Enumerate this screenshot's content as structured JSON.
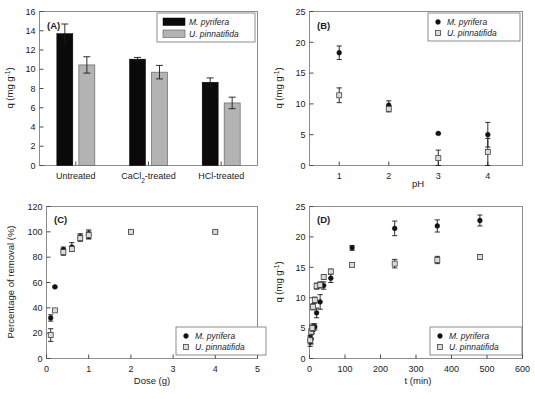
{
  "figure": {
    "series": {
      "a_name": "M. pyrifera",
      "b_name": "U. pinnatifida",
      "a_color": "#0a0a0a",
      "b_color": "#b3b3b3"
    }
  },
  "chart_data": [
    {
      "panel": "A",
      "label": "(A)",
      "type": "bar",
      "title": "",
      "xlabel": "",
      "ylabel": "q (mg g⁻¹)",
      "categories": [
        "Untreated",
        "CaCl₂-treated",
        "HCl-treated"
      ],
      "ylim": [
        0,
        16
      ],
      "yticks": [
        0,
        2,
        4,
        6,
        8,
        10,
        12,
        14,
        16
      ],
      "grid": false,
      "legend_position": "top-right",
      "series": [
        {
          "name": "M. pyrifera",
          "values": [
            13.7,
            11.05,
            8.65
          ],
          "errors": [
            1.0,
            0.18,
            0.45
          ]
        },
        {
          "name": "U. pinnatifida",
          "values": [
            10.45,
            9.7,
            6.5
          ],
          "errors": [
            0.85,
            0.7,
            0.6
          ]
        }
      ]
    },
    {
      "panel": "B",
      "label": "(B)",
      "type": "scatter",
      "title": "",
      "xlabel": "pH",
      "ylabel": "q (mg g⁻¹)",
      "xlim": [
        0.4,
        4.7
      ],
      "ylim": [
        0,
        25
      ],
      "xticks": [
        1,
        2,
        3,
        4
      ],
      "yticks": [
        0,
        5,
        10,
        15,
        20,
        25
      ],
      "grid": false,
      "legend_position": "top-right",
      "series": [
        {
          "name": "M. pyrifera",
          "x": [
            1,
            2,
            3,
            4
          ],
          "values": [
            18.3,
            9.8,
            5.2,
            5.0
          ],
          "errors": [
            1.1,
            0.7,
            0.1,
            2.0
          ]
        },
        {
          "name": "U. pinnatifida",
          "x": [
            1,
            2,
            3,
            4
          ],
          "values": [
            11.4,
            9.2,
            1.2,
            2.2
          ],
          "errors": [
            1.2,
            0.5,
            1.3,
            2.2
          ]
        }
      ]
    },
    {
      "panel": "C",
      "label": "(C)",
      "type": "scatter",
      "title": "",
      "xlabel": "Dose (g)",
      "ylabel": "Percentage of removal (%)",
      "xlim": [
        0,
        5
      ],
      "ylim": [
        0,
        120
      ],
      "xticks": [
        0,
        1,
        2,
        3,
        4,
        5
      ],
      "yticks": [
        0,
        20,
        40,
        60,
        80,
        100,
        120
      ],
      "grid": false,
      "legend_position": "bottom-right",
      "series": [
        {
          "name": "M. pyrifera",
          "x": [
            0.1,
            0.2,
            0.4,
            0.6,
            0.8,
            1.0,
            2.0,
            4.0
          ],
          "values": [
            32,
            56.5,
            86,
            88,
            96,
            98,
            100,
            100
          ],
          "errors": [
            2.5,
            0.6,
            2.0,
            3.5,
            2.5,
            3.5,
            0.6,
            0.6
          ]
        },
        {
          "name": "U. pinnatifida",
          "x": [
            0.1,
            0.2,
            0.4,
            0.6,
            0.8,
            1.0,
            2.0,
            4.0
          ],
          "values": [
            18.5,
            38,
            84,
            86.5,
            95,
            97.5,
            100,
            100
          ],
          "errors": [
            5.0,
            1.0,
            2.5,
            2.0,
            2.5,
            3.0,
            0.6,
            0.6
          ]
        }
      ]
    },
    {
      "panel": "D",
      "label": "(D)",
      "type": "scatter",
      "title": "",
      "xlabel": "t (min)",
      "ylabel": "q (mg g⁻¹)",
      "xlim": [
        0,
        600
      ],
      "ylim": [
        0,
        25
      ],
      "xticks": [
        0,
        100,
        200,
        300,
        400,
        500,
        600
      ],
      "yticks": [
        0,
        5,
        10,
        15,
        20,
        25
      ],
      "grid": false,
      "legend_position": "bottom-right",
      "series": [
        {
          "name": "M. pyrifera",
          "x": [
            2,
            5,
            8,
            10,
            15,
            20,
            30,
            40,
            60,
            120,
            240,
            360,
            480
          ],
          "values": [
            2.9,
            3.2,
            4.6,
            5.1,
            5.2,
            7.5,
            9.3,
            12.0,
            13.2,
            18.2,
            21.4,
            21.8,
            22.7
          ],
          "errors": [
            0.9,
            0.8,
            0.5,
            0.6,
            0.5,
            0.8,
            1.2,
            0.6,
            0.7,
            0.4,
            1.2,
            1.0,
            0.9
          ]
        },
        {
          "name": "U. pinnatifida",
          "x": [
            2,
            5,
            8,
            10,
            15,
            20,
            30,
            40,
            60,
            120,
            240,
            360,
            480
          ],
          "values": [
            3.0,
            4.4,
            5.0,
            8.5,
            9.6,
            11.9,
            12.1,
            13.4,
            14.3,
            15.4,
            15.6,
            16.2,
            16.7
          ],
          "errors": [
            0.6,
            0.5,
            0.5,
            0.5,
            0.5,
            0.5,
            0.5,
            0.4,
            0.4,
            0.3,
            0.7,
            0.6,
            0.4
          ]
        }
      ]
    }
  ]
}
